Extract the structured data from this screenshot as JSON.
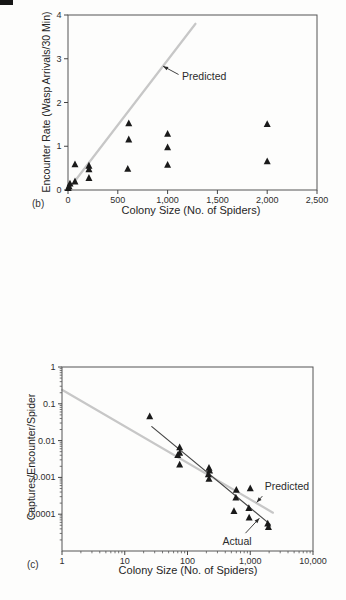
{
  "figure": {
    "panels": [
      "(b)",
      "(c)"
    ]
  },
  "chart_data": [
    {
      "panel_label": "(b)",
      "type": "scatter",
      "xlabel": "Colony Size (No. of Spiders)",
      "ylabel": "Encounter Rate (Wasp Arrivals/30 Min)",
      "xscale": "linear",
      "yscale": "linear",
      "xlim": [
        0,
        2500
      ],
      "ylim": [
        0,
        4
      ],
      "xtick_values": [
        0,
        500,
        1000,
        1500,
        2000,
        2500
      ],
      "xtick_labels": [
        "0",
        "500",
        "1,000",
        "1,500",
        "2,000",
        "2,500"
      ],
      "ytick_values": [
        0,
        1,
        2,
        3,
        4
      ],
      "ytick_labels": [
        "0",
        "1",
        "2",
        "3",
        "4"
      ],
      "grid": false,
      "marker": "triangle",
      "marker_color": "#1a1a1a",
      "points": [
        [
          2,
          0.04
        ],
        [
          10,
          0.08
        ],
        [
          20,
          0.14
        ],
        [
          70,
          0.58
        ],
        [
          70,
          0.19
        ],
        [
          210,
          0.55
        ],
        [
          210,
          0.47
        ],
        [
          210,
          0.27
        ],
        [
          610,
          1.52
        ],
        [
          610,
          1.15
        ],
        [
          600,
          0.48
        ],
        [
          1000,
          1.28
        ],
        [
          1000,
          0.97
        ],
        [
          1000,
          0.57
        ],
        [
          2000,
          1.5
        ],
        [
          2000,
          0.65
        ]
      ],
      "lines": [
        {
          "name": "Predicted",
          "color": "#c7c7c7",
          "width": 2.2,
          "from": [
            0,
            0
          ],
          "to": [
            1280,
            3.8
          ]
        }
      ],
      "annotations": [
        {
          "text": "Predicted",
          "anchor": "start",
          "text_at": [
            1145,
            2.52
          ],
          "arrow_from": [
            1110,
            2.64
          ],
          "arrow_to": [
            955,
            2.83
          ]
        }
      ]
    },
    {
      "panel_label": "(c)",
      "type": "scatter",
      "xlabel": "Colony Size (No. of Spiders)",
      "ylabel": "Captures/Encounter/Spider",
      "xscale": "log",
      "yscale": "log",
      "xlim": [
        1,
        10000
      ],
      "ylim": [
        1e-05,
        1
      ],
      "xtick_values": [
        1,
        10,
        100,
        1000,
        10000
      ],
      "xtick_labels": [
        "1",
        "10",
        "100",
        "1,000",
        "10,000"
      ],
      "ytick_values": [
        1,
        0.1,
        0.01,
        0.001,
        0.0001
      ],
      "ytick_labels": [
        "1",
        "0.1",
        "0.01",
        "0.001",
        "0.0001"
      ],
      "grid": false,
      "marker": "triangle",
      "marker_color": "#1a1a1a",
      "points": [
        [
          25,
          0.045
        ],
        [
          75,
          0.0065
        ],
        [
          75,
          0.0046
        ],
        [
          70,
          0.004
        ],
        [
          75,
          0.0022
        ],
        [
          220,
          0.0018
        ],
        [
          225,
          0.0015
        ],
        [
          215,
          0.0012
        ],
        [
          220,
          0.0009
        ],
        [
          600,
          0.00045
        ],
        [
          1000,
          0.0005
        ],
        [
          590,
          0.00028
        ],
        [
          550,
          0.00012
        ],
        [
          950,
          0.000145
        ],
        [
          960,
          8e-05
        ],
        [
          1900,
          5.5e-05
        ],
        [
          1950,
          4.4e-05
        ]
      ],
      "lines": [
        {
          "name": "Predicted",
          "color": "#c7c7c7",
          "width": 2.2,
          "from": [
            1,
            0.24
          ],
          "to": [
            2300,
            0.00011
          ]
        },
        {
          "name": "Actual",
          "color": "#474747",
          "width": 1.2,
          "from": [
            27,
            0.024
          ],
          "to": [
            2075,
            5.3e-05
          ]
        }
      ],
      "annotations": [
        {
          "text": "Predicted",
          "anchor": "start",
          "text_at": [
            1700,
            0.00046
          ],
          "arrow_from": [
            1560,
            0.00031
          ],
          "arrow_to": [
            1270,
            0.00021
          ]
        },
        {
          "text": "Actual",
          "anchor": "start",
          "text_at": [
            360,
            1.5e-05
          ],
          "arrow_from": [
            840,
            3.05e-05
          ],
          "arrow_to": [
            1400,
            7.8e-05
          ]
        }
      ]
    }
  ]
}
